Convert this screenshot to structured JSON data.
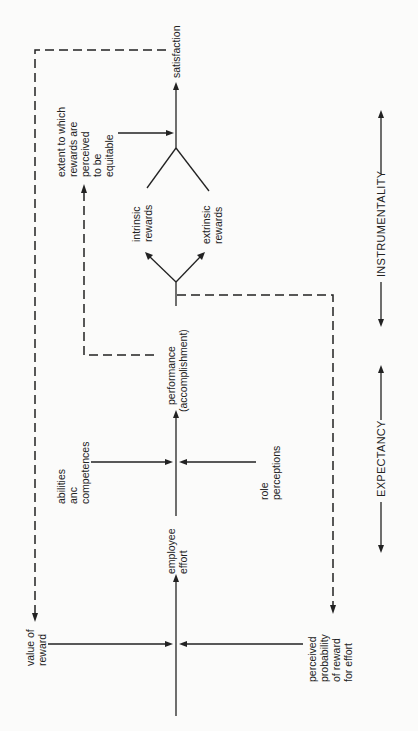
{
  "diagram": {
    "orientation": "rotated-90-ccw",
    "nodes": {
      "satisfaction": [
        "satisfaction"
      ],
      "equitable_rewards": [
        "extent to which",
        "rewards are",
        "perceived",
        "to be",
        "equitable"
      ],
      "intrinsic_rewards": [
        "intrinsic",
        "rewards"
      ],
      "extrinsic_rewards": [
        "extrinsic",
        "rewards"
      ],
      "performance": [
        "performance",
        "(accomplishment)"
      ],
      "abilities": [
        "abilities",
        "anc",
        "competences"
      ],
      "role_perceptions": [
        "role",
        "perceptions"
      ],
      "employee_effort": [
        "employee",
        "effort"
      ],
      "value_of_reward": [
        "value of",
        "reward"
      ],
      "perceived_probability": [
        "perceived",
        "probability",
        "of reward",
        "for effort"
      ]
    },
    "axis_labels": {
      "instrumentality": "INSTRUMENTALITY",
      "expectancy": "EXPECTANCY"
    },
    "edges": [
      {
        "from": "value of reward",
        "to": "employee effort",
        "style": "solid"
      },
      {
        "from": "perceived probability of reward for effort",
        "to": "employee effort",
        "style": "solid"
      },
      {
        "from": "employee effort",
        "to": "performance (accomplishment)",
        "style": "solid"
      },
      {
        "from": "abilities anc competences",
        "to": "performance (accomplishment)",
        "style": "solid"
      },
      {
        "from": "role perceptions",
        "to": "performance (accomplishment)",
        "style": "solid"
      },
      {
        "from": "performance (accomplishment)",
        "to": "intrinsic rewards",
        "style": "solid"
      },
      {
        "from": "performance (accomplishment)",
        "to": "extrinsic rewards",
        "style": "solid"
      },
      {
        "from": "intrinsic rewards",
        "to": "satisfaction",
        "style": "solid"
      },
      {
        "from": "extrinsic rewards",
        "to": "satisfaction",
        "style": "solid"
      },
      {
        "from": "extent to which rewards are perceived to be equitable",
        "to": "satisfaction",
        "style": "solid"
      },
      {
        "from": "performance (accomplishment)",
        "to": "extent to which rewards are perceived to be equitable",
        "style": "dashed"
      },
      {
        "from": "satisfaction",
        "to": "value of reward",
        "style": "dashed"
      },
      {
        "from": "performance (accomplishment)",
        "to": "perceived probability of reward for effort",
        "style": "dashed"
      }
    ]
  }
}
